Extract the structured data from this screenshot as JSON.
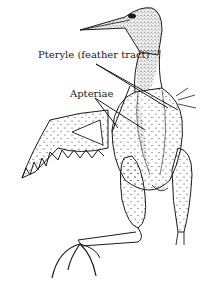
{
  "figure": {
    "labels": {
      "pteryle": "Pteryle (feather tract)",
      "apteriae": "Apteriae"
    },
    "colors": {
      "ink": "#1a1a1a",
      "background": "#ffffff"
    }
  }
}
